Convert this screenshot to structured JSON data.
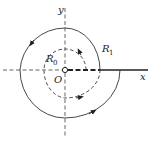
{
  "diagram": {
    "colors": {
      "stroke": "#333333",
      "axis": "#555555",
      "background": "#ffffff"
    },
    "labels": {
      "y_axis": "y",
      "x_axis": "x",
      "origin": "O",
      "inner_radius": "R",
      "inner_radius_sub": "0",
      "outer_radius": "R",
      "outer_radius_sub": "1"
    },
    "elements": {
      "origin_point": "small hollow circle at origin",
      "inner_contour": "dashed counterclockwise spiral near radius R0",
      "outer_contour": "solid counterclockwise spiral near radius R1",
      "branch_cut": "thick line along positive x-axis"
    },
    "arrows": [
      {
        "on": "inner_contour",
        "direction": "counterclockwise",
        "position": "upper-right"
      },
      {
        "on": "inner_contour",
        "direction": "counterclockwise",
        "position": "bottom"
      },
      {
        "on": "outer_contour",
        "direction": "counterclockwise",
        "position": "upper-left"
      },
      {
        "on": "outer_contour",
        "direction": "counterclockwise",
        "position": "lower-right"
      }
    ]
  }
}
